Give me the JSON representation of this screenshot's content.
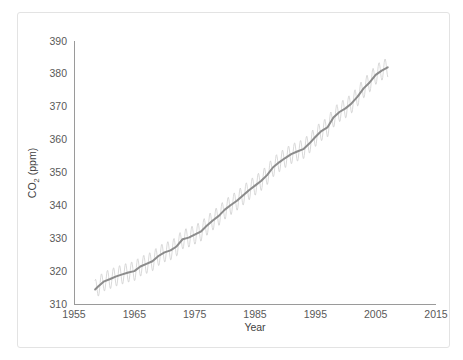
{
  "figure": {
    "card_border_color": "#e3e3e3",
    "background_color": "#ffffff",
    "top_artifact_text": " "
  },
  "chart_data": {
    "type": "line",
    "title": "",
    "subtitle": "",
    "xlabel": "Year",
    "ylabel": "CO₂ (ppm)",
    "ylabel_base": "CO",
    "ylabel_sub": "2",
    "ylabel_unit": " (ppm)",
    "xlim": [
      1955,
      2015
    ],
    "ylim": [
      310,
      390
    ],
    "xticks": [
      1955,
      1965,
      1975,
      1985,
      1995,
      2005,
      2015
    ],
    "xtick_labels": [
      "1955",
      "1965",
      "1975",
      "1985",
      "1995",
      "2005",
      "2015"
    ],
    "yticks": [
      310,
      320,
      330,
      340,
      350,
      360,
      370,
      380,
      390
    ],
    "ytick_labels": [
      "310",
      "320",
      "330",
      "340",
      "350",
      "360",
      "370",
      "380",
      "390"
    ],
    "grid": false,
    "legend": "none",
    "colors": {
      "raw": "#cfcfcf",
      "trend": "#8c8c8c",
      "axis": "#9a9a9a",
      "text": "#595959"
    },
    "seasonal_amplitude_ppm": 3.0,
    "x": [
      1958.5,
      1959,
      1960,
      1961,
      1962,
      1963,
      1964,
      1965,
      1966,
      1967,
      1968,
      1969,
      1970,
      1971,
      1972,
      1973,
      1974,
      1975,
      1976,
      1977,
      1978,
      1979,
      1980,
      1981,
      1982,
      1983,
      1984,
      1985,
      1986,
      1987,
      1988,
      1989,
      1990,
      1991,
      1992,
      1993,
      1994,
      1995,
      1996,
      1997,
      1998,
      1999,
      2000,
      2001,
      2002,
      2003,
      2004,
      2005,
      2006,
      2007
    ],
    "series": [
      {
        "name": "CO2 annual mean (trend)",
        "values": [
          314.4,
          315.3,
          316.9,
          317.6,
          318.4,
          319.0,
          319.6,
          320.0,
          321.4,
          322.2,
          323.0,
          324.6,
          325.7,
          326.3,
          327.5,
          329.7,
          330.2,
          331.1,
          332.0,
          333.8,
          335.4,
          336.8,
          338.7,
          340.1,
          341.4,
          343.0,
          344.6,
          346.0,
          347.4,
          349.2,
          351.6,
          353.1,
          354.4,
          355.6,
          356.4,
          357.1,
          358.8,
          360.8,
          362.6,
          363.7,
          366.7,
          368.4,
          369.5,
          371.0,
          373.1,
          375.6,
          377.4,
          379.7,
          381.0,
          382.0
        ]
      }
    ]
  }
}
